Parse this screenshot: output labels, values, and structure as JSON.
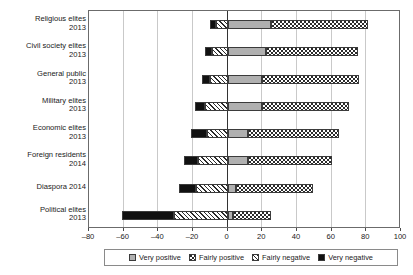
{
  "chart_data": {
    "type": "bar",
    "orientation": "horizontal",
    "stacked": "diverging",
    "title": "",
    "subtitle": "",
    "xlabel": "",
    "ylabel": "",
    "xlim": [
      -80,
      100
    ],
    "xticks": [
      -80,
      -60,
      -40,
      -20,
      0,
      20,
      40,
      60,
      80,
      100
    ],
    "xtick_labels": [
      "–80",
      "–60",
      "–40",
      "–20",
      "0",
      "20",
      "40",
      "60",
      "80",
      "100"
    ],
    "grid": "vertical",
    "legend_position": "bottom",
    "categories": [
      {
        "line1": "Religious elites",
        "line2": "2013"
      },
      {
        "line1": "Civil society elites",
        "line2": "2013"
      },
      {
        "line1": "General public",
        "line2": "2013"
      },
      {
        "line1": "Military elites",
        "line2": "2013"
      },
      {
        "line1": "Economic elites",
        "line2": "2013"
      },
      {
        "line1": "Foreign residents",
        "line2": "2014"
      },
      {
        "line1": "Diaspora 2014",
        "line2": ""
      },
      {
        "line1": "Political elites",
        "line2": "2013"
      }
    ],
    "series": [
      {
        "name": "Very positive",
        "key": "very_positive",
        "values": [
          25,
          22,
          20,
          20,
          12,
          12,
          5,
          3
        ]
      },
      {
        "name": "Fairly positive",
        "key": "fairly_positive",
        "values": [
          56,
          53,
          56,
          50,
          52,
          48,
          44,
          22
        ]
      },
      {
        "name": "Fairly negative",
        "key": "fairly_negative",
        "values": [
          -7,
          -9,
          -10,
          -13,
          -12,
          -17,
          -18,
          -31
        ]
      },
      {
        "name": "Very negative",
        "key": "very_negative",
        "values": [
          -3,
          -4,
          -5,
          -6,
          -9,
          -8,
          -10,
          -30
        ]
      }
    ],
    "legend": [
      {
        "label": "Very positive",
        "key": "very_positive"
      },
      {
        "label": "Fairly positive",
        "key": "fairly_positive"
      },
      {
        "label": "Fairly negative",
        "key": "fairly_negative"
      },
      {
        "label": "Very negative",
        "key": "very_negative"
      }
    ]
  }
}
